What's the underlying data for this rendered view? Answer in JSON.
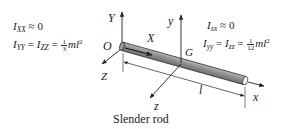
{
  "figure": {
    "caption": "Slender rod",
    "left_equations": {
      "line1": {
        "lhs": "I",
        "lhs_sub": "XX",
        "op": "≈",
        "rhs": "0"
      },
      "line2": {
        "a": "I",
        "a_sub": "YY",
        "eq1": "=",
        "b": "I",
        "b_sub": "ZZ",
        "eq2": "=",
        "frac_num": "1",
        "frac_den": "3",
        "tail": "ml",
        "tail_sup": "2"
      }
    },
    "right_equations": {
      "line1": {
        "lhs": "I",
        "lhs_sub": "xx",
        "op": "≈",
        "rhs": "0"
      },
      "line2": {
        "a": "I",
        "a_sub": "yy",
        "eq1": "=",
        "b": "I",
        "b_sub": "zz",
        "eq2": "=",
        "frac_num": "1",
        "frac_den": "12",
        "tail": "ml",
        "tail_sup": "2"
      }
    },
    "axis_labels": {
      "origin": "O",
      "Y": "Y",
      "X": "X",
      "Z": "Z",
      "G": "G",
      "y": "y",
      "x": "x",
      "z": "z",
      "length": "l"
    },
    "colors": {
      "rod_fill": "#8c8c8c",
      "rod_highlight": "#b5b5b5",
      "line": "#222222"
    }
  }
}
